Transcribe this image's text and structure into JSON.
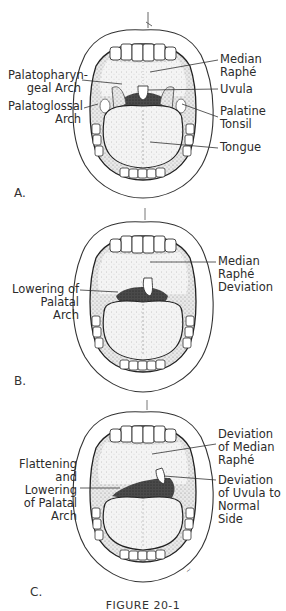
{
  "figure": {
    "caption": "FIGURE 20-1",
    "panels": [
      {
        "letter": "A.",
        "labels_left": [
          {
            "text": "Palatopharyn-\ngeal Arch"
          },
          {
            "text": "Palatoglossal\nArch"
          }
        ],
        "labels_right": [
          {
            "text": "Median\nRaphé"
          },
          {
            "text": "Uvula"
          },
          {
            "text": "Palatine\nTonsil"
          },
          {
            "text": "Tongue"
          }
        ]
      },
      {
        "letter": "B.",
        "labels_left": [
          {
            "text": "Lowering of\nPalatal\nArch"
          }
        ],
        "labels_right": [
          {
            "text": "Median\nRaphé\nDeviation"
          }
        ]
      },
      {
        "letter": "C.",
        "labels_left": [
          {
            "text": "Flattening\nand\nLowering\nof Palatal\nArch"
          }
        ],
        "labels_right": [
          {
            "text": "Deviation\nof Median\nRaphé"
          },
          {
            "text": "Deviation\nof Uvula to\nNormal\nSide"
          }
        ]
      }
    ]
  },
  "colors": {
    "ink": "#2b2b2b",
    "stipple": "#9a9a9a",
    "throat": "#3a3a3a",
    "background": "#ffffff"
  }
}
